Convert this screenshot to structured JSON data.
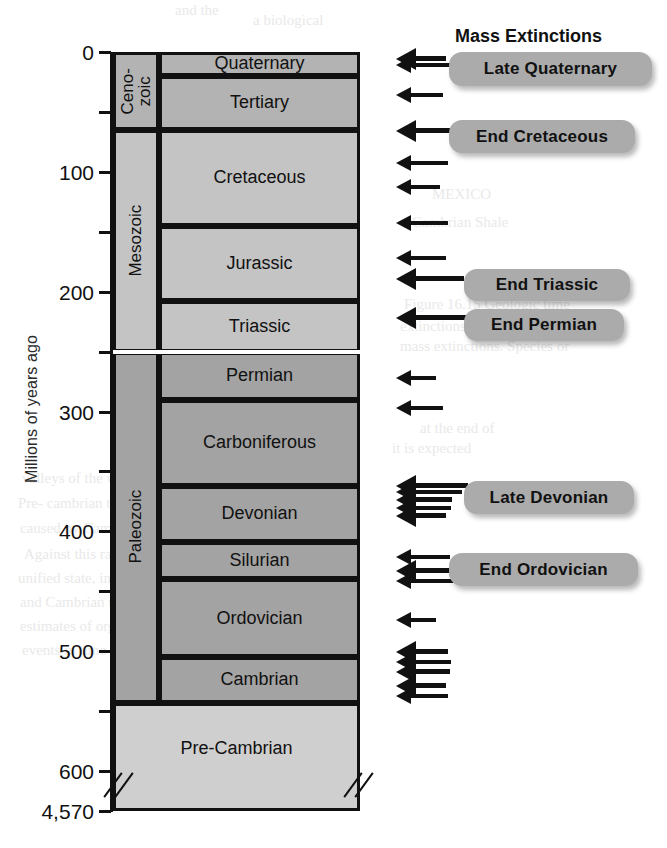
{
  "heading": {
    "text": "Mass Extinctions",
    "left": 455,
    "top": 26
  },
  "axis": {
    "title": "Millions of years ago",
    "ticks": [
      {
        "label": "0",
        "value": 0
      },
      {
        "label": "",
        "value": 50
      },
      {
        "label": "100",
        "value": 100
      },
      {
        "label": "",
        "value": 150
      },
      {
        "label": "200",
        "value": 200
      },
      {
        "label": "",
        "value": 250
      },
      {
        "label": "300",
        "value": 300
      },
      {
        "label": "",
        "value": 350
      },
      {
        "label": "400",
        "value": 400
      },
      {
        "label": "",
        "value": 450
      },
      {
        "label": "500",
        "value": 500
      },
      {
        "label": "",
        "value": 550
      },
      {
        "label": "600",
        "value": 600
      },
      {
        "label": "4,570",
        "value": 4570
      }
    ]
  },
  "chart_data": {
    "type": "table",
    "ylabel": "Millions of years ago",
    "ylim": [
      0,
      4570
    ],
    "axis_break": {
      "from": 600,
      "to": 4570,
      "note": "axis broken between 600 and 4,570 Ma"
    },
    "eras": [
      {
        "name": "Ceno-\nzoic",
        "label": "Ceno- zoic",
        "start": 0,
        "end": 65,
        "tone": "#b3b3b3"
      },
      {
        "name": "Mesozoic",
        "label": "Mesozoic",
        "start": 65,
        "end": 250,
        "tone": "#c4c4c4"
      },
      {
        "name": "Paleozoic",
        "label": "Paleozoic",
        "start": 250,
        "end": 543,
        "tone": "#a3a3a3"
      }
    ],
    "periods": [
      {
        "name": "Quaternary",
        "start": 0,
        "end": 20,
        "tone": "#b3b3b3"
      },
      {
        "name": "Tertiary",
        "start": 20,
        "end": 65,
        "tone": "#b3b3b3"
      },
      {
        "name": "Cretaceous",
        "start": 65,
        "end": 145,
        "tone": "#c4c4c4"
      },
      {
        "name": "Jurassic",
        "start": 145,
        "end": 208,
        "tone": "#c4c4c4"
      },
      {
        "name": "Triassic",
        "start": 208,
        "end": 250,
        "tone": "#c4c4c4"
      },
      {
        "name": "Permian",
        "start": 250,
        "end": 290,
        "tone": "#a3a3a3"
      },
      {
        "name": "Carboniferous",
        "start": 290,
        "end": 362,
        "tone": "#a3a3a3"
      },
      {
        "name": "Devonian",
        "start": 362,
        "end": 409,
        "tone": "#a3a3a3"
      },
      {
        "name": "Silurian",
        "start": 409,
        "end": 440,
        "tone": "#a3a3a3"
      },
      {
        "name": "Ordovician",
        "start": 440,
        "end": 505,
        "tone": "#a3a3a3"
      },
      {
        "name": "Cambrian",
        "start": 505,
        "end": 543,
        "tone": "#a3a3a3"
      }
    ],
    "precambrian": {
      "name": "Pre-Cambrian",
      "start": 543,
      "end": 4570,
      "tone": "#cfcfcf"
    },
    "extinction_labels": [
      {
        "name": "Late Quaternary",
        "top": 52,
        "left": 449,
        "width": 203,
        "height": 34
      },
      {
        "name": "End Cretaceous",
        "top": 120,
        "left": 449,
        "width": 186,
        "height": 33
      },
      {
        "name": "End Triassic",
        "top": 269,
        "left": 464,
        "width": 166,
        "height": 32
      },
      {
        "name": "End Permian",
        "top": 309,
        "left": 464,
        "width": 160,
        "height": 32
      },
      {
        "name": "Late Devonian",
        "top": 481,
        "left": 464,
        "width": 170,
        "height": 33
      },
      {
        "name": "End Ordinovician",
        "label": "End Ordovician",
        "top": 553,
        "left": 449,
        "width": 189,
        "height": 33
      }
    ],
    "extinction_arrows": [
      {
        "y": 59,
        "length": 50,
        "size": "big"
      },
      {
        "y": 65,
        "length": 55,
        "size": "small"
      },
      {
        "y": 95,
        "length": 47,
        "size": "small"
      },
      {
        "y": 131,
        "length": 72,
        "size": "big"
      },
      {
        "y": 163,
        "length": 52,
        "size": "small"
      },
      {
        "y": 187,
        "length": 44,
        "size": "small"
      },
      {
        "y": 223,
        "length": 52,
        "size": "small"
      },
      {
        "y": 258,
        "length": 50,
        "size": "small"
      },
      {
        "y": 279,
        "length": 68,
        "size": "big"
      },
      {
        "y": 318,
        "length": 116,
        "size": "big"
      },
      {
        "y": 378,
        "length": 40,
        "size": "small"
      },
      {
        "y": 408,
        "length": 47,
        "size": "small"
      },
      {
        "y": 486,
        "length": 72,
        "size": "big"
      },
      {
        "y": 492,
        "length": 66,
        "size": "small"
      },
      {
        "y": 500,
        "length": 56,
        "size": "big"
      },
      {
        "y": 508,
        "length": 55,
        "size": "small"
      },
      {
        "y": 516,
        "length": 50,
        "size": "big"
      },
      {
        "y": 557,
        "length": 54,
        "size": "small"
      },
      {
        "y": 571,
        "length": 63,
        "size": "big"
      },
      {
        "y": 581,
        "length": 58,
        "size": "small"
      },
      {
        "y": 620,
        "length": 40,
        "size": "small"
      },
      {
        "y": 652,
        "length": 52,
        "size": "big"
      },
      {
        "y": 662,
        "length": 55,
        "size": "small"
      },
      {
        "y": 672,
        "length": 54,
        "size": "big"
      },
      {
        "y": 686,
        "length": 50,
        "size": "big"
      },
      {
        "y": 696,
        "length": 52,
        "size": "small"
      }
    ]
  },
  "ghost_text": [
    {
      "t": "and the",
      "x": 175,
      "y": 2
    },
    {
      "t": "a biological",
      "x": 253,
      "y": 12
    },
    {
      "t": "MEXICO",
      "x": 432,
      "y": 186
    },
    {
      "t": "Cambrian Shale",
      "x": 412,
      "y": 214
    },
    {
      "t": "Figure 16.15 Geologic time",
      "x": 404,
      "y": 296
    },
    {
      "t": "extinctions. Sources indicate",
      "x": 400,
      "y": 318
    },
    {
      "t": "mass extinctions. Species or",
      "x": 400,
      "y": 338
    },
    {
      "t": "at the end of",
      "x": 420,
      "y": 420
    },
    {
      "t": "it is expected",
      "x": 392,
      "y": 440
    },
    {
      "t": "valleys of the wide",
      "x": 22,
      "y": 470
    },
    {
      "t": "Pre- cambrian the",
      "x": 18,
      "y": 495
    },
    {
      "t": "caused by Cambrian",
      "x": 20,
      "y": 520
    },
    {
      "t": "Against this radiation",
      "x": 24,
      "y": 546
    },
    {
      "t": "unified state, in general",
      "x": 18,
      "y": 570
    },
    {
      "t": "and Cambrian this",
      "x": 20,
      "y": 594
    },
    {
      "t": "estimates of organisms that occurred in a geological",
      "x": 20,
      "y": 618
    },
    {
      "t": "events in time",
      "x": 22,
      "y": 642
    }
  ]
}
